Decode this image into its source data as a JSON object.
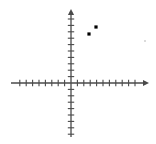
{
  "figure": {
    "title": "",
    "background_color": "#ffffff",
    "axis_color": "#4a4a4a",
    "tick_color": "#4a4a4a",
    "point_color": "#000000",
    "faint_point_color": "#c8c8c8"
  },
  "chart_data": {
    "type": "scatter",
    "title": "",
    "xlabel": "",
    "ylabel": "",
    "xlim": [
      -10,
      13
    ],
    "ylim": [
      -9,
      12
    ],
    "grid": false,
    "legend": null,
    "axis_style": "tick-marked cartesian axes with arrowheads",
    "tick_spacing": 1,
    "x_ticks_negative_count": 8,
    "x_ticks_positive_count": 12,
    "y_ticks_positive_count": 11,
    "y_ticks_negative_count": 8,
    "tick_labels": [],
    "points": [
      {
        "label": "A",
        "x": 3,
        "y": 9,
        "px": 89,
        "py": 34,
        "size": 3.2,
        "faint": false
      },
      {
        "label": "B",
        "x": 4,
        "y": 10,
        "px": 96,
        "py": 27,
        "size": 3.2,
        "faint": false
      },
      {
        "label": "C",
        "x": 12.5,
        "y": 7,
        "px": 145,
        "py": 41,
        "size": 1.6,
        "faint": true
      }
    ],
    "series": [
      {
        "name": "points",
        "x": [
          3,
          4,
          12.5
        ],
        "y": [
          9,
          10,
          7
        ]
      }
    ]
  },
  "geometry": {
    "origin_x": 71,
    "origin_y": 83,
    "x_axis_start": 11,
    "x_axis_end": 149,
    "y_axis_top": 9,
    "y_axis_bottom": 137,
    "tick_step_px": 6.4,
    "tick_half_len": 3.2,
    "axis_stroke_width": 1.3
  },
  "labels": {
    "x_axis_name": "x-axis",
    "y_axis_name": "y-axis",
    "origin_name": "origin"
  }
}
